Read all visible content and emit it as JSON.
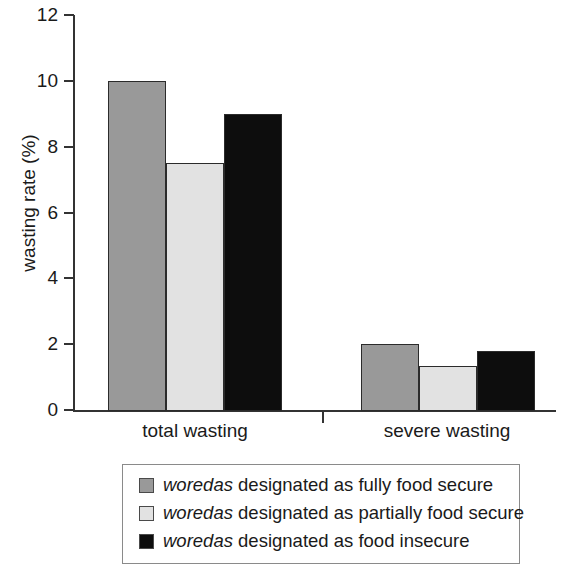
{
  "chart_data": {
    "type": "bar",
    "title": "",
    "xlabel": "",
    "ylabel": "wasting rate (%)",
    "categories": [
      "total wasting",
      "severe wasting"
    ],
    "ylim": [
      0,
      12
    ],
    "yticks": [
      0,
      2,
      4,
      6,
      8,
      10,
      12
    ],
    "ytick_labels": [
      "0",
      "2",
      "4",
      "6",
      "8",
      "10",
      "12"
    ],
    "grid": false,
    "legend_position": "below",
    "series": [
      {
        "name": "woredas designated as fully food secure",
        "color": "#999999",
        "values": [
          10.0,
          2.0
        ]
      },
      {
        "name": "woredas designated as partially food secure",
        "color": "#e2e2e2",
        "values": [
          7.5,
          1.35
        ]
      },
      {
        "name": "woredas designated as food insecure",
        "color": "#0d0d0d",
        "values": [
          9.0,
          1.8
        ]
      }
    ]
  },
  "axis": {
    "y_title": "wasting rate (%)"
  },
  "legend": {
    "items": [
      {
        "emphasis": "woredas",
        "rest": " designated as fully food secure",
        "color": "#999999"
      },
      {
        "emphasis": "woredas",
        "rest": " designated as partially food secure",
        "color": "#e2e2e2"
      },
      {
        "emphasis": "woredas",
        "rest": " designated as food insecure",
        "color": "#0d0d0d"
      }
    ]
  }
}
